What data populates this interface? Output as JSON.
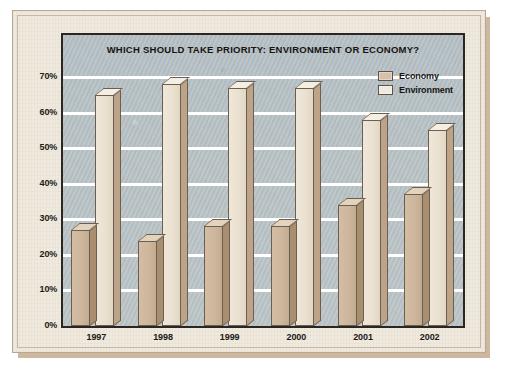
{
  "chart_data": {
    "type": "bar",
    "title": "WHICH SHOULD TAKE PRIORITY: ENVIRONMENT OR ECONOMY?",
    "xlabel": "",
    "ylabel": "",
    "categories": [
      "1997",
      "1998",
      "1999",
      "2000",
      "2001",
      "2002"
    ],
    "series": [
      {
        "name": "Economy",
        "values": [
          27,
          24,
          28,
          28,
          34,
          37
        ]
      },
      {
        "name": "Environment",
        "values": [
          65,
          68,
          67,
          67,
          58,
          55
        ]
      }
    ],
    "ylim": [
      0,
      70
    ],
    "ytick_labels": [
      "70%",
      "60%",
      "50%",
      "40%",
      "30%",
      "20%",
      "10%",
      "0%"
    ],
    "ytick_values": [
      70,
      60,
      50,
      40,
      30,
      20,
      10,
      0
    ],
    "grid": true,
    "legend_position": "top-right",
    "colors": {
      "economy": "#d3bda4",
      "environment": "#efe7d9",
      "bar_outline": "#6b5f52",
      "plot_background": "#b9c3c6",
      "gridline": "#ffffff",
      "frame": "#2b2622",
      "page": "#efe9de",
      "text": "#1d1a17"
    }
  },
  "legend": {
    "items": [
      {
        "label": "Economy",
        "key": "economy"
      },
      {
        "label": "Environment",
        "key": "environment"
      }
    ]
  }
}
